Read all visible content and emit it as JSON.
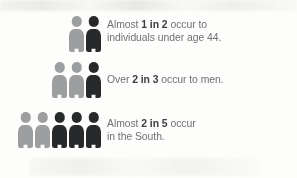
{
  "infographic": {
    "palette": {
      "background": "#fdfdfc",
      "figure_light": "#9d9e9f",
      "figure_dark": "#28292b",
      "text_regular": "#6f7173",
      "text_bold": "#3b3d3f"
    },
    "rows": [
      {
        "id": "age",
        "name": "stat-row-age",
        "pictogram": {
          "total": 2,
          "highlighted": 1,
          "figures": [
            "light",
            "dark"
          ]
        },
        "text_lines": [
          {
            "segments": [
              {
                "text": "Almost ",
                "bold": false
              },
              {
                "text": "1 in 2",
                "bold": true
              },
              {
                "text": " occur to",
                "bold": false
              }
            ]
          },
          {
            "segments": [
              {
                "text": "individuals under age 44.",
                "bold": false
              }
            ]
          }
        ],
        "plain_text": "Almost 1 in 2 occur to individuals under age 44.",
        "fraction": "1 in 2"
      },
      {
        "id": "gender",
        "name": "stat-row-gender",
        "pictogram": {
          "total": 3,
          "highlighted": 1,
          "figures": [
            "light",
            "light",
            "dark"
          ]
        },
        "text_lines": [
          {
            "segments": [
              {
                "text": "Over ",
                "bold": false
              },
              {
                "text": "2 in 3",
                "bold": true
              },
              {
                "text": " occur to men.",
                "bold": false
              }
            ]
          }
        ],
        "plain_text": "Over 2 in 3 occur to men.",
        "fraction": "2 in 3"
      },
      {
        "id": "region",
        "name": "stat-row-region",
        "pictogram": {
          "total": 5,
          "highlighted": 3,
          "figures": [
            "light",
            "light",
            "dark",
            "dark",
            "dark"
          ]
        },
        "text_lines": [
          {
            "segments": [
              {
                "text": "Almost ",
                "bold": false
              },
              {
                "text": "2 in 5",
                "bold": true
              },
              {
                "text": " occur",
                "bold": false
              }
            ]
          },
          {
            "segments": [
              {
                "text": "in the South.",
                "bold": false
              }
            ]
          }
        ],
        "plain_text": "Almost 2 in 5 occur in the South.",
        "fraction": "2 in 5"
      }
    ]
  }
}
